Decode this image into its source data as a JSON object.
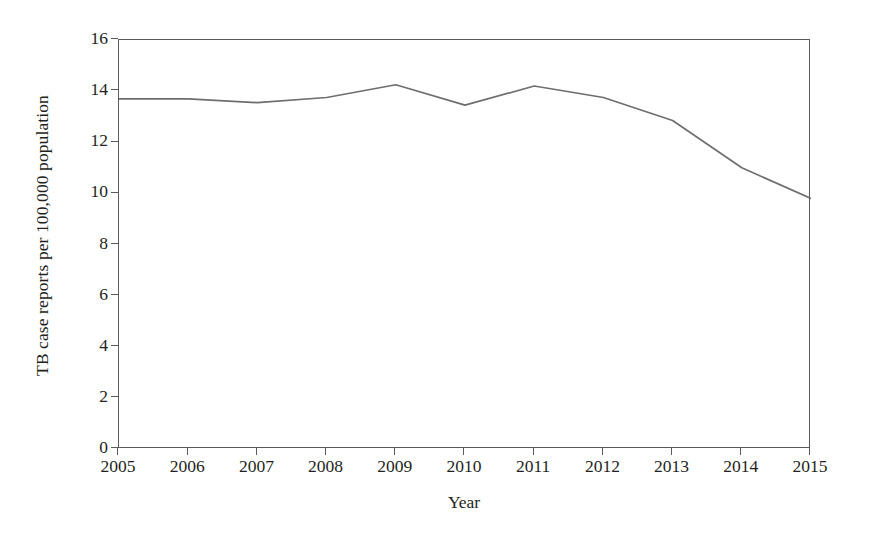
{
  "chart_data": {
    "type": "line",
    "title": "",
    "xlabel": "Year",
    "ylabel": "TB case reports per 100,000 population",
    "categories": [
      "2005",
      "2006",
      "2007",
      "2008",
      "2009",
      "2010",
      "2011",
      "2012",
      "2013",
      "2014",
      "2015"
    ],
    "x": [
      2005,
      2006,
      2007,
      2008,
      2009,
      2010,
      2011,
      2012,
      2013,
      2014,
      2015
    ],
    "values": [
      13.7,
      13.7,
      13.55,
      13.75,
      14.25,
      13.45,
      14.2,
      13.75,
      12.85,
      11.0,
      9.8
    ],
    "series": [
      {
        "name": "TB case reports per 100,000 population",
        "values": [
          13.7,
          13.7,
          13.55,
          13.75,
          14.25,
          13.45,
          14.2,
          13.75,
          12.85,
          11.0,
          9.8
        ]
      }
    ],
    "xlim": [
      2005,
      2015
    ],
    "ylim": [
      0,
      16
    ],
    "ytick_labels": [
      "0",
      "2",
      "4",
      "6",
      "8",
      "10",
      "12",
      "14",
      "16"
    ],
    "ytick_values": [
      0,
      2,
      4,
      6,
      8,
      10,
      12,
      14,
      16
    ],
    "xtick_labels": [
      "2005",
      "2006",
      "2007",
      "2008",
      "2009",
      "2010",
      "2011",
      "2012",
      "2013",
      "2014",
      "2015"
    ],
    "grid": false,
    "legend": "none",
    "line_color": "#6e6e6e",
    "axis_color": "#5b5b5b",
    "background_color": "#ffffff",
    "text_color": "#231f20"
  },
  "axes": {
    "ylabel": "TB case reports per 100,000 population",
    "xlabel": "Year"
  }
}
